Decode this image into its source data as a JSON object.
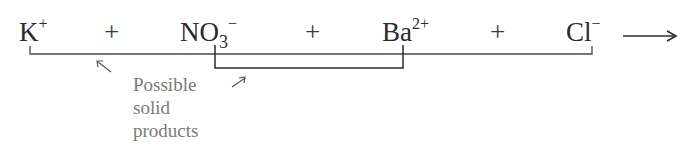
{
  "equation": {
    "ions": [
      {
        "symbol": "K",
        "subscript": "",
        "charge": "+"
      },
      {
        "symbol": "NO",
        "subscript": "3",
        "charge": "−"
      },
      {
        "symbol": "Ba",
        "subscript": "",
        "charge": "2+"
      },
      {
        "symbol": "Cl",
        "subscript": "",
        "charge": "−"
      }
    ],
    "operators": [
      "+",
      "+",
      "+"
    ],
    "reaction_arrow": "⟶"
  },
  "annotation": {
    "lines": [
      "Possible",
      "solid",
      "products"
    ],
    "pointer_left": "↖",
    "pointer_right": "↗"
  },
  "colors": {
    "text": "#2b2b2b",
    "annotation": "#7a7a7a",
    "connector": "#3a3a3a"
  }
}
